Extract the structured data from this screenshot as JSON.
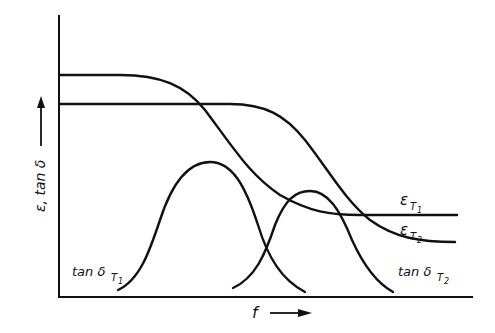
{
  "diagram": {
    "type": "dielectric dispersion schematic",
    "x_axis": {
      "label": "f",
      "arrow": "right-arrow"
    },
    "y_axis": {
      "label": "ε, tan δ",
      "arrow": "up-arrow"
    },
    "curves": [
      {
        "id": "eps_T1",
        "label_main": "ε",
        "label_sub": "T",
        "label_subsub": "1",
        "description": "permittivity at T1, high plateau then drops to upper low plateau"
      },
      {
        "id": "eps_T2",
        "label_main": "ε",
        "label_sub": "T",
        "label_subsub": "2",
        "description": "permittivity at T2, lower plateau then drops later to lower plateau"
      },
      {
        "id": "tan_T1",
        "label_main": "tan δ",
        "label_sub": "T",
        "label_subsub": "1",
        "description": "loss peak at T1 (lower frequency)"
      },
      {
        "id": "tan_T2",
        "label_main": "tan δ",
        "label_sub": "T",
        "label_subsub": "2",
        "description": "loss peak at T2 (higher frequency)"
      }
    ]
  }
}
